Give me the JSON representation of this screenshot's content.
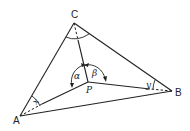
{
  "diagram": {
    "type": "triangle-with-interior-point",
    "vertices": {
      "A": {
        "label": "A"
      },
      "B": {
        "label": "B"
      },
      "C": {
        "label": "C"
      },
      "P": {
        "label": "P"
      }
    },
    "angles": {
      "alpha": {
        "label": "α",
        "at": "P",
        "between": [
          "PC",
          "PA"
        ]
      },
      "beta": {
        "label": "β",
        "at": "P",
        "between": [
          "PC",
          "PB"
        ]
      },
      "x": {
        "label": "x",
        "at": "A",
        "between": [
          "AC",
          "AP"
        ]
      },
      "y": {
        "label": "y",
        "at": "B",
        "between": [
          "BC",
          "BP"
        ]
      },
      "c": {
        "label": "",
        "at": "C",
        "between": [
          "CA",
          "CB"
        ]
      }
    },
    "segments": [
      {
        "from": "A",
        "to": "B",
        "style": "solid"
      },
      {
        "from": "B",
        "to": "C",
        "style": "solid"
      },
      {
        "from": "C",
        "to": "A",
        "style": "solid"
      },
      {
        "from": "C",
        "to": "P",
        "style": "solid-with-dashed-start"
      },
      {
        "from": "A",
        "to": "P",
        "style": "solid-with-dashed-start"
      },
      {
        "from": "B",
        "to": "P",
        "style": "solid-with-dashed-start"
      }
    ],
    "colors": {
      "stroke": "#222222",
      "background": "#ffffff"
    }
  }
}
